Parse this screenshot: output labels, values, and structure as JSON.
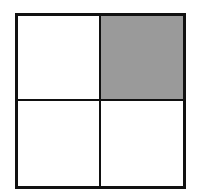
{
  "diagram": {
    "type": "2x2 grid",
    "rows": 2,
    "columns": 2,
    "cells": [
      {
        "position": "top-left",
        "shaded": false
      },
      {
        "position": "top-right",
        "shaded": true
      },
      {
        "position": "bottom-left",
        "shaded": false
      },
      {
        "position": "bottom-right",
        "shaded": false
      }
    ],
    "shaded_fraction": "1/4",
    "colors": {
      "shade": "#9a9a9a",
      "border": "#111111",
      "background": "#ffffff"
    }
  }
}
